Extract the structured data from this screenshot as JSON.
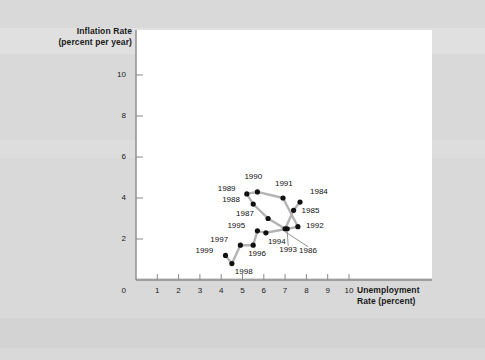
{
  "figure": {
    "background_color": "#d9d9d9",
    "plot_background_color": "#ffffff",
    "line_color": "#b3b3b3",
    "marker_color": "#111111"
  },
  "axes": {
    "y_title_line1": "Inflation Rate",
    "y_title_line2": "(percent per year)",
    "x_title_line1": "Unemployment",
    "x_title_line2": "Rate (percent)",
    "origin_label": "0",
    "x_ticks": [
      "1",
      "2",
      "3",
      "4",
      "5",
      "6",
      "7",
      "8",
      "9",
      "10"
    ],
    "y_ticks": [
      "2",
      "4",
      "6",
      "8",
      "10"
    ]
  },
  "chart_data": {
    "type": "scatter",
    "title": "",
    "xlabel": "Unemployment Rate (percent)",
    "ylabel": "Inflation Rate (percent per year)",
    "xlim": [
      0,
      10.8
    ],
    "ylim": [
      0,
      11.2
    ],
    "grid": false,
    "legend": "none",
    "connected": true,
    "series": [
      {
        "name": "U.S. inflation vs unemployment, 1984-1999",
        "points": [
          {
            "label": "1984",
            "x": 7.7,
            "y": 3.8
          },
          {
            "label": "1985",
            "x": 7.4,
            "y": 3.4
          },
          {
            "label": "1986",
            "x": 7.0,
            "y": 2.5
          },
          {
            "label": "1987",
            "x": 6.2,
            "y": 3.0
          },
          {
            "label": "1988",
            "x": 5.5,
            "y": 3.7
          },
          {
            "label": "1989",
            "x": 5.2,
            "y": 4.2
          },
          {
            "label": "1990",
            "x": 5.7,
            "y": 4.3
          },
          {
            "label": "1991",
            "x": 6.9,
            "y": 4.0
          },
          {
            "label": "1992",
            "x": 7.6,
            "y": 2.6
          },
          {
            "label": "1993",
            "x": 7.1,
            "y": 2.5
          },
          {
            "label": "1994",
            "x": 6.1,
            "y": 2.3
          },
          {
            "label": "1995",
            "x": 5.7,
            "y": 2.4
          },
          {
            "label": "1996",
            "x": 5.5,
            "y": 1.7
          },
          {
            "label": "1997",
            "x": 4.9,
            "y": 1.7
          },
          {
            "label": "1998",
            "x": 4.5,
            "y": 0.8
          },
          {
            "label": "1999",
            "x": 4.2,
            "y": 1.2
          }
        ],
        "path_order": [
          "1984",
          "1985",
          "1986",
          "1987",
          "1988",
          "1989",
          "1990",
          "1991",
          "1992",
          "1993",
          "1994",
          "1995",
          "1996",
          "1997",
          "1998",
          "1999"
        ]
      }
    ]
  },
  "point_labels": {
    "y1984": "1984",
    "y1985": "1985",
    "y1986": "1986",
    "y1987": "1987",
    "y1988": "1988",
    "y1989": "1989",
    "y1990": "1990",
    "y1991": "1991",
    "y1992": "1992",
    "y1993": "1993",
    "y1994": "1994",
    "y1995": "1995",
    "y1996": "1996",
    "y1997": "1997",
    "y1998": "1998",
    "y1999": "1999"
  }
}
